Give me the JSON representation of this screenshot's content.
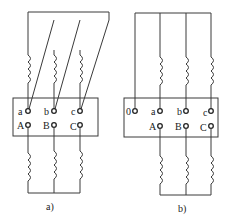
{
  "diagram": {
    "panels": [
      {
        "id": "a",
        "caption": "a)",
        "upper_terminals": [
          "a",
          "b",
          "c"
        ],
        "lower_terminals": [
          "A",
          "B",
          "C"
        ],
        "upper_connection": "delta",
        "lower_connection": "wye"
      },
      {
        "id": "b",
        "caption": "b)",
        "upper_terminals": [
          "0",
          "a",
          "b",
          "c"
        ],
        "lower_terminals": [
          "A",
          "B",
          "C"
        ],
        "upper_connection": "wye-neutral",
        "lower_connection": "wye"
      }
    ]
  }
}
